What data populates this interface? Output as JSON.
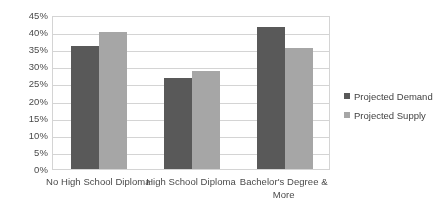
{
  "chart_data": {
    "type": "bar",
    "title": "",
    "subtitle": "",
    "xlabel": "",
    "ylabel": "",
    "categories": [
      "No High School Diploma",
      "High School Diploma",
      "Bachelor's Degree & More"
    ],
    "series": [
      {
        "name": "Projected Demand",
        "color": "#595959",
        "values": [
          36,
          26.5,
          41.5
        ]
      },
      {
        "name": "Projected Supply",
        "color": "#a6a6a6",
        "values": [
          40,
          28.5,
          35.5
        ]
      }
    ],
    "ylim": [
      0,
      45
    ],
    "ytick_step": 5,
    "ytick_labels": [
      "0%",
      "5%",
      "10%",
      "15%",
      "20%",
      "25%",
      "30%",
      "35%",
      "40%",
      "45%"
    ],
    "ytick_values": [
      0,
      5,
      10,
      15,
      20,
      25,
      30,
      35,
      40,
      45
    ],
    "grid": "horizontal",
    "legend_position": "right",
    "value_suffix": "%"
  },
  "axis": {
    "y_labels": [
      "45%",
      "40%",
      "35%",
      "30%",
      "25%",
      "20%",
      "15%",
      "10%",
      "5%",
      "0%"
    ],
    "x_labels": [
      "No High School Diploma",
      "High School Diploma",
      "Bachelor's Degree & More"
    ]
  },
  "legend": {
    "entries": [
      {
        "label": "Projected Demand",
        "color": "#595959"
      },
      {
        "label": "Projected Supply",
        "color": "#a6a6a6"
      }
    ]
  },
  "colors": {
    "demand": "#595959",
    "supply": "#a6a6a6",
    "grid": "#d4d4d4",
    "text": "#3f3f3f",
    "background": "#ffffff"
  }
}
